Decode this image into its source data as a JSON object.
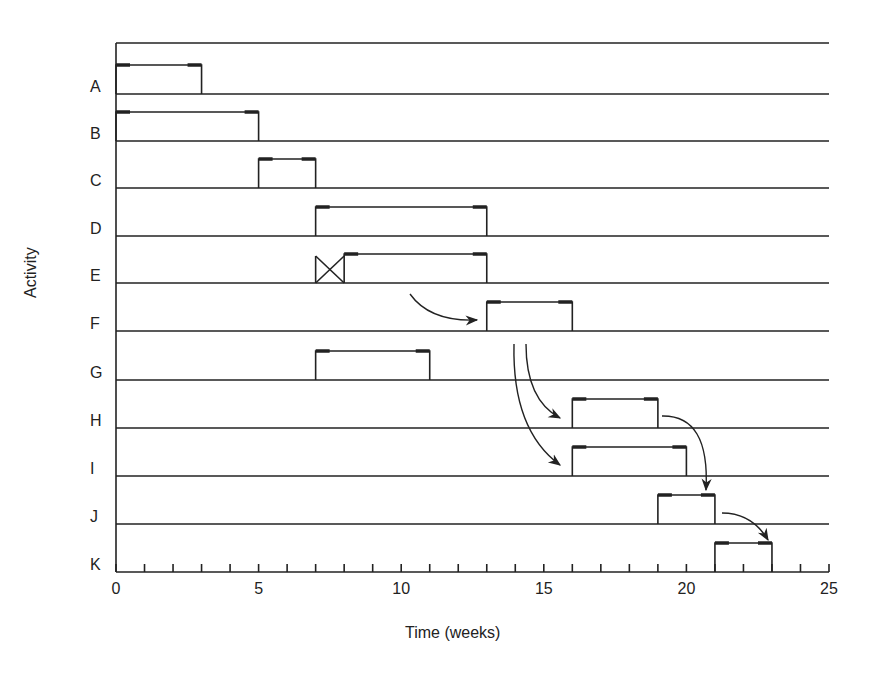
{
  "chart_data": {
    "type": "gantt",
    "title": "",
    "xlabel": "Time (weeks)",
    "ylabel": "Activity",
    "xlim": [
      0,
      25
    ],
    "xticks": [
      0,
      5,
      10,
      15,
      20,
      25
    ],
    "minor_tick_step": 1,
    "grid": "horizontal row lines",
    "categories": [
      "A",
      "B",
      "C",
      "D",
      "E",
      "F",
      "G",
      "H",
      "I",
      "J",
      "K"
    ],
    "tasks": [
      {
        "activity": "A",
        "start": 0,
        "end": 3
      },
      {
        "activity": "B",
        "start": 0,
        "end": 5
      },
      {
        "activity": "C",
        "start": 5,
        "end": 7
      },
      {
        "activity": "D",
        "start": 7,
        "end": 13
      },
      {
        "activity": "E",
        "start": 8,
        "end": 13,
        "delay_marker": {
          "start": 7,
          "end": 8,
          "symbol": "X"
        }
      },
      {
        "activity": "F",
        "start": 13,
        "end": 16
      },
      {
        "activity": "G",
        "start": 7,
        "end": 11
      },
      {
        "activity": "H",
        "start": 16,
        "end": 19
      },
      {
        "activity": "I",
        "start": 16,
        "end": 20
      },
      {
        "activity": "J",
        "start": 19,
        "end": 21
      },
      {
        "activity": "K",
        "start": 21,
        "end": 23
      }
    ],
    "dependencies": [
      {
        "from": "E",
        "to": "F"
      },
      {
        "from": "F",
        "to": "H"
      },
      {
        "from": "F",
        "to": "I"
      },
      {
        "from": "H",
        "to": "J"
      },
      {
        "from": "J",
        "to": "K"
      }
    ]
  }
}
